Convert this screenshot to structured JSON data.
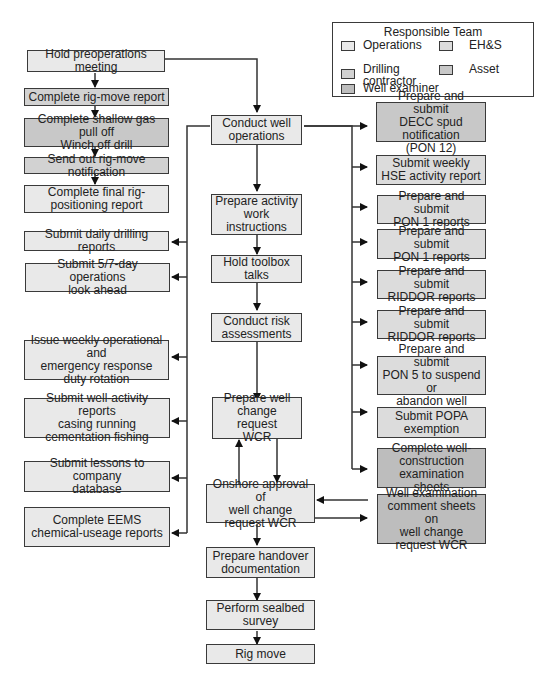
{
  "legend": {
    "title": "Responsible Team",
    "items": [
      {
        "label": "Operations",
        "color": "#e9e9e9"
      },
      {
        "label": "EH&S",
        "color": "#dcdcdc"
      },
      {
        "label": "Drilling\ncontractor",
        "color": "#d2d2d2"
      },
      {
        "label": "Asset",
        "color": "#c8c8c8"
      },
      {
        "label": "Well examiner",
        "color": "#bdbdbd"
      }
    ]
  },
  "left_column": [
    "Hold preoperations meeting",
    "Complete rig-move report",
    "Complete shallow gas pull off\nWinch off drill",
    "Send out rig-move notification",
    "Complete final rig-\npositioning report",
    "Submit daily drilling reports",
    "Submit 5/7-day operations\nlook ahead",
    "Issue weekly operational and\nemergency response\nduty rotation",
    "Submit well-activity reports\ncasing running\ncementation fishing",
    "Submit lessons to company\ndatabase",
    "Complete EEMS\nchemical-useage reports"
  ],
  "center_column": [
    "Conduct well\noperations",
    "Prepare activity\nwork\ninstructions",
    "Hold toolbox\ntalks",
    "Conduct risk\nassessments",
    "Prepare well\nchange request\nWCR",
    "Onshore approval of\nwell change\nrequest WCR",
    "Prepare handover\ndocumentation",
    "Perform sealbed\nsurvey",
    "Rig move"
  ],
  "right_column": [
    "Prepare and submit\nDECC spud notification\n(PON 12)",
    "Submit weekly\nHSE activity report",
    "Prepare and submit\nPON 1 reports",
    "Prepare and submit\nPON 1 reports",
    "Prepare and submit\nRIDDOR reports",
    "Prepare and submit\nRIDDOR reports",
    "Prepare and submit\nPON 5 to suspend or\nabandon well",
    "Submit POPA\nexemption",
    "Complete well-\nconstruction\nexamination sheets",
    "Well examination\ncomment sheets on\nwell change\nrequest WCR"
  ]
}
